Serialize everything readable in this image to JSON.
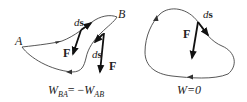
{
  "left_diagram": {
    "points": {
      "start": "A",
      "end": "B"
    },
    "upper_path": {
      "ds_label": "ds",
      "force_label": "F"
    },
    "lower_path": {
      "ds_label": "ds",
      "force_label": "F"
    },
    "caption": {
      "W": "W",
      "sub1": "BA",
      "eq": "= −",
      "W2": "W",
      "sub2": "AB"
    }
  },
  "right_diagram": {
    "ds_label": "ds",
    "force_label": "F",
    "caption": "W=0"
  },
  "colors": {
    "curve": "#444444",
    "vector": "#111111",
    "text": "#222222",
    "background": "#ffffff"
  }
}
